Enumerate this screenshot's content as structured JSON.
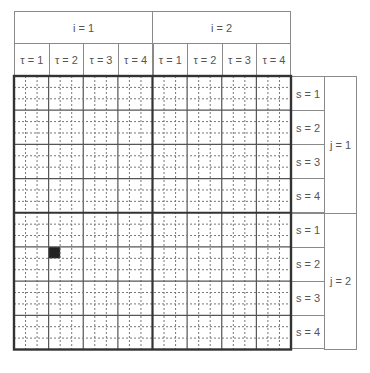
{
  "header": {
    "i_labels": [
      "i = 1",
      "i = 2"
    ],
    "tau_labels": [
      "τ = 1",
      "τ = 2",
      "τ = 3",
      "τ = 4",
      "τ = 1",
      "τ = 2",
      "τ = 3",
      "τ = 4"
    ]
  },
  "side": {
    "s_labels": [
      "s = 1",
      "s = 2",
      "s = 3",
      "s = 4",
      "s = 1",
      "s = 2",
      "s = 3",
      "s = 4"
    ],
    "j_labels": [
      "j = 1",
      "j = 2"
    ]
  },
  "grid": {
    "cols": 24,
    "rows": 24,
    "sub_per_cell": 3,
    "filled_cells": [
      {
        "row": 15,
        "col": 3
      }
    ],
    "colors": {
      "thick": "#333333",
      "solid": "#555555",
      "dashed": "#777777",
      "fill": "#222222"
    }
  }
}
